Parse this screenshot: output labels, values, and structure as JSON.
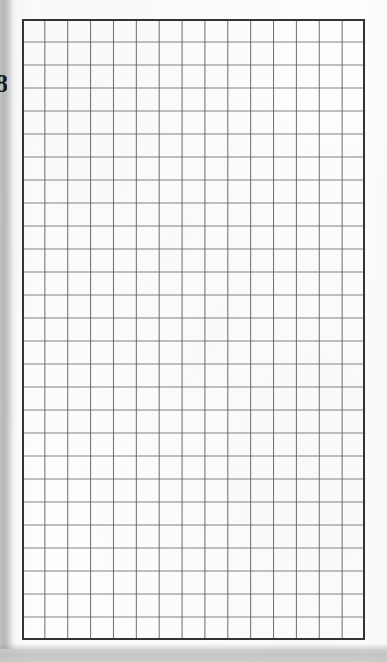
{
  "document": {
    "type": "graph-paper-scan",
    "description": "Scanned page of blank quadrille / graph paper",
    "page_background_color": "#fdfdfd",
    "canvas_width": 387,
    "canvas_height": 662
  },
  "margin": {
    "left_strip_color": "#c4c4c4",
    "left_strip_width": 9,
    "glyph_text": "8",
    "glyph_note": "partially cropped dark character at left edge",
    "glyph_color": "#1a1a1a"
  },
  "grid": {
    "columns": 15,
    "rows": 27,
    "cell_width": 22.87,
    "cell_height": 23.0,
    "origin_x": 22,
    "origin_y": 19,
    "width": 343,
    "height": 621,
    "line_color": "#5a5a62",
    "border_color": "#33333a",
    "line_width": 1,
    "border_width": 2,
    "content": "",
    "content_note": "grid is empty — no writing, drawing or marks"
  },
  "footer": {
    "band_color": "#c9c9c9",
    "band_height": 13,
    "band_note": "gray surface visible below the page"
  }
}
